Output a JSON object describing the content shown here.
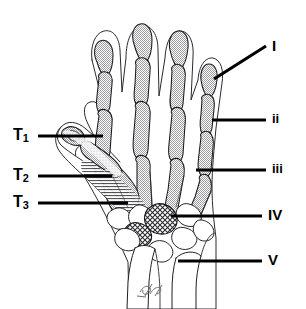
{
  "figure": {
    "signature": "artist-signature-mark",
    "clipped_header_text": "",
    "ink_color": "#000000",
    "bone_fill": "#c9c9c9",
    "background": "#ffffff"
  },
  "labels": {
    "left": [
      {
        "id": "T1",
        "text": "T",
        "subscript": "1",
        "target": "thumb-distal-phalanx"
      },
      {
        "id": "T2",
        "text": "T",
        "subscript": "2",
        "target": "thumb-proximal-phalanx"
      },
      {
        "id": "T3",
        "text": "T",
        "subscript": "3",
        "target": "first-metacarpal"
      }
    ],
    "right": [
      {
        "id": "I",
        "text": "I",
        "target": "fifth-digit"
      },
      {
        "id": "ii",
        "text": "ii",
        "target": "proximal-phalanx"
      },
      {
        "id": "iii",
        "text": "iii",
        "target": "metacarpal"
      },
      {
        "id": "IV",
        "text": "IV",
        "target": "carpal-bones"
      },
      {
        "id": "V",
        "text": "V",
        "target": "forearm-radius-ulna"
      }
    ]
  }
}
